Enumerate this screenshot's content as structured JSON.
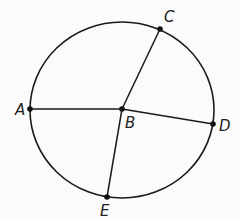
{
  "diagram": {
    "type": "circle-with-radii",
    "circle": {
      "cx": 122,
      "cy": 110,
      "rx": 92,
      "ry": 88,
      "stroke": "#1a1a1a"
    },
    "center": {
      "name": "B",
      "x": 122,
      "y": 109,
      "label": "B",
      "label_x": 125,
      "label_y": 128
    },
    "points": [
      {
        "name": "A",
        "x": 30,
        "y": 109,
        "label": "A",
        "label_x": 15,
        "label_y": 115
      },
      {
        "name": "C",
        "x": 160,
        "y": 29,
        "label": "C",
        "label_x": 164,
        "label_y": 22
      },
      {
        "name": "D",
        "x": 213,
        "y": 124,
        "label": "D",
        "label_x": 219,
        "label_y": 131
      },
      {
        "name": "E",
        "x": 107,
        "y": 197,
        "label": "E",
        "label_x": 100,
        "label_y": 216
      }
    ],
    "segments": [
      {
        "from": "A",
        "to": "B"
      },
      {
        "from": "B",
        "to": "C"
      },
      {
        "from": "B",
        "to": "D"
      },
      {
        "from": "B",
        "to": "E"
      }
    ],
    "colors": {
      "line": "#1a1a1a",
      "point": "#111111",
      "background": "#fbfbfb"
    }
  }
}
